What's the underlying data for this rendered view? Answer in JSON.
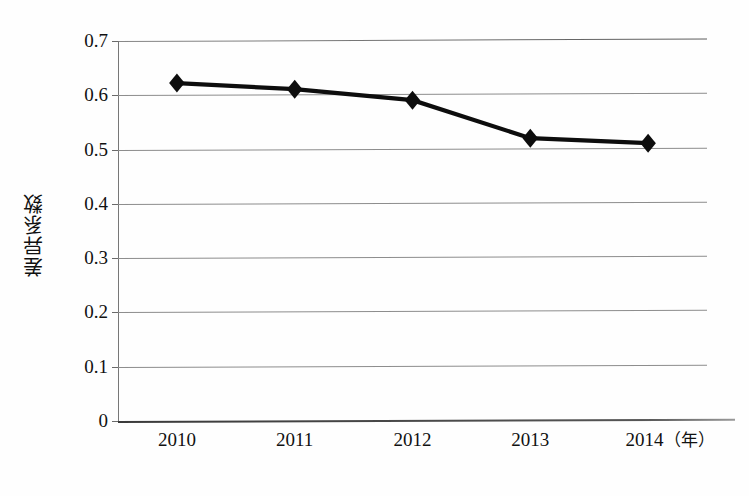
{
  "chart_data": {
    "type": "line",
    "title": "",
    "xlabel": "年",
    "ylabel": "差异系数",
    "categories": [
      "2010",
      "2011",
      "2012",
      "2013",
      "2014"
    ],
    "x_tick_labels": [
      "2010",
      "2011",
      "2012",
      "2013",
      "2014（年）"
    ],
    "last_label_year": "2014",
    "last_label_unit": "（年）",
    "values": [
      0.622,
      0.61,
      0.589,
      0.518,
      0.508
    ],
    "series": [
      {
        "name": "差异系数",
        "values": [
          0.622,
          0.61,
          0.589,
          0.518,
          0.508
        ],
        "marker": "diamond",
        "line_color": "#0d0d0d",
        "marker_color": "#0d0d0d"
      }
    ],
    "ylim": [
      0,
      0.7
    ],
    "xlim_categories": 5,
    "y_ticks": [
      0,
      0.1,
      0.2,
      0.3,
      0.4,
      0.5,
      0.6,
      0.7
    ],
    "y_tick_labels": [
      "0",
      "0.1",
      "0.2",
      "0.3",
      "0.4",
      "0.5",
      "0.6",
      "0.7"
    ],
    "grid": true,
    "grid_axis": "y",
    "grid_color": "#8d8d8d",
    "legend": false,
    "legend_position": "none",
    "plot_background": "#ffffff",
    "axis_color": "#6e6e6e"
  }
}
